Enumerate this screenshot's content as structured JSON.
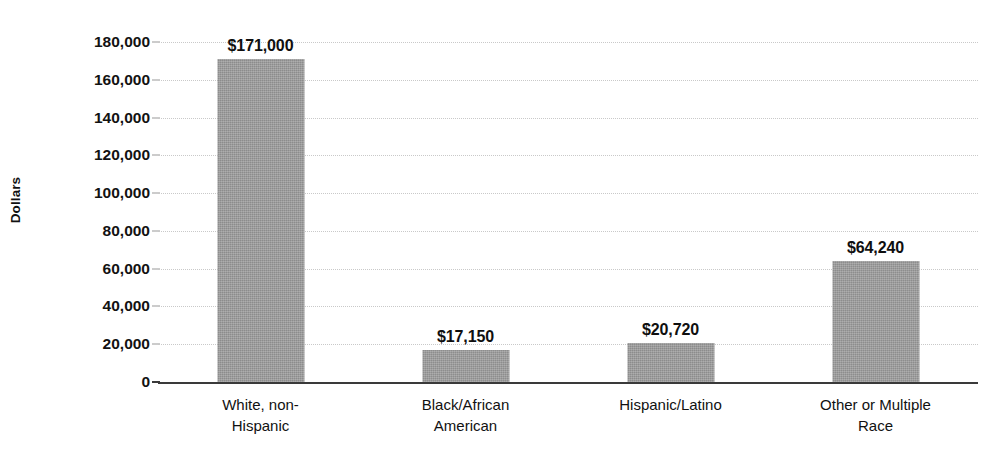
{
  "chart_data": {
    "type": "bar",
    "title": "",
    "xlabel": "",
    "ylabel": "Dollars",
    "ylim": [
      0,
      180000
    ],
    "grid": true,
    "legend": "none",
    "categories": [
      "White, non-\nHispanic",
      "Black/African\nAmerican",
      "Hispanic/Latino",
      "Other or Multiple\nRace"
    ],
    "values": [
      171000,
      17150,
      20720,
      64240
    ],
    "value_labels": [
      "$171,000",
      "$17,150",
      "$20,720",
      "$64,240"
    ],
    "ytick_values": [
      0,
      20000,
      40000,
      60000,
      80000,
      100000,
      120000,
      140000,
      160000,
      180000
    ],
    "ytick_labels": [
      "0",
      "20,000",
      "40,000",
      "60,000",
      "80,000",
      "100,000",
      "120,000",
      "140,000",
      "160,000",
      "180,000"
    ],
    "bar_color": "#9b9b9b",
    "axis_color": "#3a3a3a",
    "grid_color": "#c9c9c9",
    "text_color": "#111111"
  }
}
